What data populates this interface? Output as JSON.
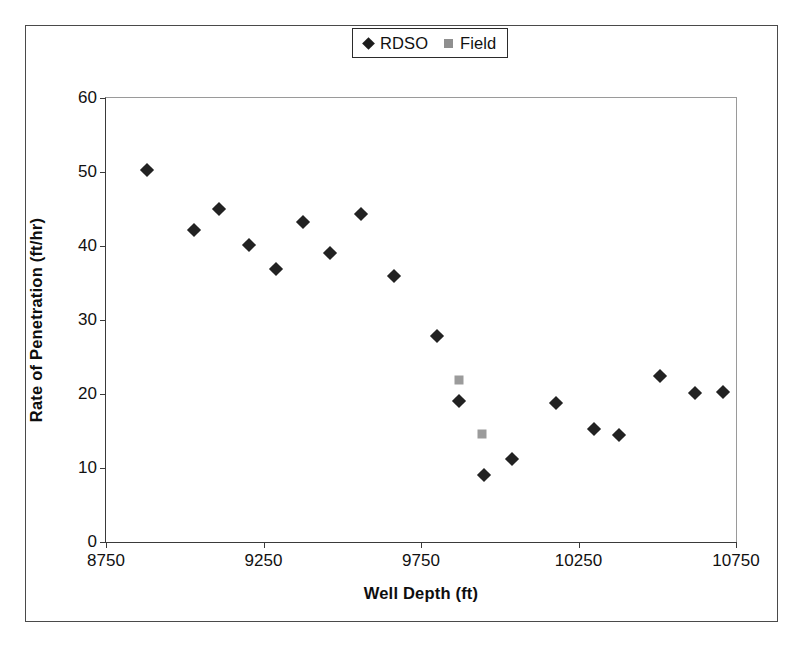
{
  "chart_data": {
    "type": "scatter",
    "title": "",
    "xlabel": "Well Depth (ft)",
    "ylabel": "Rate of Penetration (ft/hr)",
    "xlim": [
      8750,
      10750
    ],
    "ylim": [
      0,
      60
    ],
    "xticks": [
      8750,
      9250,
      9750,
      10250,
      10750
    ],
    "yticks": [
      0,
      10,
      20,
      30,
      40,
      50,
      60
    ],
    "grid": false,
    "legend_position": "top-center",
    "series": [
      {
        "name": "RDSO",
        "marker": "diamond",
        "color": "#222222",
        "points": [
          [
            8880,
            50.3
          ],
          [
            9030,
            42.2
          ],
          [
            9110,
            45.0
          ],
          [
            9205,
            40.1
          ],
          [
            9290,
            36.9
          ],
          [
            9375,
            43.2
          ],
          [
            9460,
            39.0
          ],
          [
            9560,
            44.3
          ],
          [
            9665,
            36.0
          ],
          [
            9800,
            27.8
          ],
          [
            9870,
            19.0
          ],
          [
            9950,
            9.1
          ],
          [
            10040,
            11.2
          ],
          [
            10180,
            18.8
          ],
          [
            10300,
            15.3
          ],
          [
            10380,
            14.4
          ],
          [
            10510,
            22.4
          ],
          [
            10620,
            20.2
          ],
          [
            10710,
            20.3
          ]
        ]
      },
      {
        "name": "Field",
        "marker": "square",
        "color": "#9b9b9b",
        "points": [
          [
            9870,
            21.9
          ],
          [
            9945,
            14.6
          ]
        ]
      }
    ]
  },
  "legend": {
    "entries": [
      {
        "label": "RDSO",
        "marker": "diamond-marker-icon"
      },
      {
        "label": "Field",
        "marker": "square-marker-icon"
      }
    ]
  },
  "axes": {
    "x_title": "Well Depth (ft)",
    "y_title": "Rate of Penetration (ft/hr)",
    "x_tick_labels": [
      "8750",
      "9250",
      "9750",
      "10250",
      "10750"
    ],
    "y_tick_labels": [
      "0",
      "10",
      "20",
      "30",
      "40",
      "50",
      "60"
    ]
  },
  "colors": {
    "rdso_marker": "#222222",
    "field_marker": "#9b9b9b",
    "axis": "#3a3a3a",
    "frame": "#4a4a4a",
    "background": "#ffffff"
  }
}
